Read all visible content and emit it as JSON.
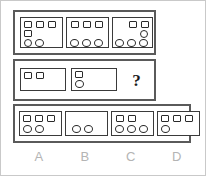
{
  "puzzle": {
    "type": "visual-analogy-matrix",
    "question_mark": "?",
    "colors": {
      "frame_stroke": "#5a5a5a",
      "panel_stroke": "#3a3a3a",
      "shape_stroke": "#2a2a2a",
      "label_text": "#b4b4b4",
      "page_border": "#c9c9c9",
      "background": "#ffffff"
    },
    "premise_row": {
      "name": "premise-row",
      "panels": [
        {
          "id": "premise-1",
          "squares": 4,
          "circles": 2,
          "layout": "3 squares across the top, 1 square at left on the second line, 2 circles along the bottom-left"
        },
        {
          "id": "premise-2",
          "squares": 3,
          "circles": 3,
          "layout": "3 squares across the top, 3 circles across the bottom"
        },
        {
          "id": "premise-3",
          "squares": 2,
          "circles": 4,
          "layout": "2 squares at the top-right, 1 circle below them at the right, 3 circles across the bottom"
        }
      ]
    },
    "question_row": {
      "name": "question-row",
      "panels": [
        {
          "id": "question-1",
          "squares": 2,
          "circles": 0,
          "layout": "2 squares at the top-left, no circles"
        },
        {
          "id": "question-2",
          "squares": 1,
          "circles": 1,
          "layout": "1 square at the top-left with 1 circle directly below it"
        },
        {
          "id": "question-3",
          "squares": null,
          "circles": null,
          "layout": "unknown - marked with a question mark"
        }
      ]
    },
    "options_row": {
      "name": "options-row",
      "options": [
        {
          "letter": "A",
          "squares": 3,
          "circles": 2,
          "layout": "3 squares across the top, 2 circles at the bottom-left"
        },
        {
          "letter": "B",
          "squares": 0,
          "circles": 2,
          "layout": "no squares, 2 circles at the bottom-left"
        },
        {
          "letter": "C",
          "squares": 2,
          "circles": 3,
          "layout": "2 squares at the top-left, 3 circles across the bottom"
        },
        {
          "letter": "D",
          "squares": 3,
          "circles": 1,
          "layout": "3 squares across the top, 1 circle at the bottom-left"
        }
      ]
    }
  }
}
